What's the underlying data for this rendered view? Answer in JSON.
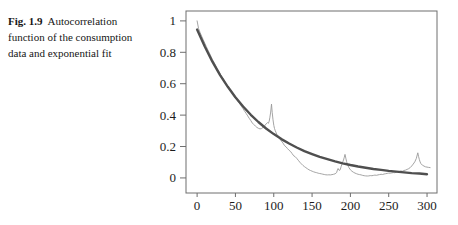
{
  "caption": {
    "label": "Fig. 1.9",
    "line1_rest": "Autocorrelation",
    "line2": "function of the consumption",
    "line3": "data and exponential fit"
  },
  "chart_data": {
    "type": "line",
    "title": "",
    "xlabel": "",
    "ylabel": "",
    "xlim": [
      -14.5,
      313
    ],
    "ylim": [
      -0.096,
      1.063
    ],
    "grid": false,
    "legend": "none",
    "frame_color": "#6e6e6e",
    "background": "#ffffff",
    "x_ticks": [
      {
        "v": 0,
        "label": "0"
      },
      {
        "v": 50,
        "label": "50"
      },
      {
        "v": 100,
        "label": "100"
      },
      {
        "v": 150,
        "label": "150"
      },
      {
        "v": 200,
        "label": "200"
      },
      {
        "v": 250,
        "label": "250"
      },
      {
        "v": 300,
        "label": "300"
      }
    ],
    "y_ticks": [
      {
        "v": 0,
        "label": "0"
      },
      {
        "v": 0.2,
        "label": "0.2"
      },
      {
        "v": 0.4,
        "label": "0.4"
      },
      {
        "v": 0.6,
        "label": "0.6"
      },
      {
        "v": 0.8,
        "label": "0.8"
      },
      {
        "v": 1,
        "label": "1"
      }
    ],
    "series": [
      {
        "name": "autocorrelation",
        "color": "#9a9a9a",
        "width": 0.9,
        "points": [
          [
            0,
            1.0
          ],
          [
            2,
            0.95
          ],
          [
            4,
            0.924
          ],
          [
            6,
            0.902
          ],
          [
            8,
            0.88
          ],
          [
            10,
            0.858
          ],
          [
            12,
            0.836
          ],
          [
            14,
            0.815
          ],
          [
            16,
            0.795
          ],
          [
            18,
            0.775
          ],
          [
            20,
            0.755
          ],
          [
            22,
            0.736
          ],
          [
            24,
            0.717
          ],
          [
            26,
            0.699
          ],
          [
            28,
            0.681
          ],
          [
            30,
            0.663
          ],
          [
            32,
            0.646
          ],
          [
            34,
            0.633
          ],
          [
            36,
            0.613
          ],
          [
            38,
            0.594
          ],
          [
            40,
            0.582
          ],
          [
            42,
            0.567
          ],
          [
            44,
            0.556
          ],
          [
            46,
            0.538
          ],
          [
            48,
            0.52
          ],
          [
            50,
            0.511
          ],
          [
            52,
            0.497
          ],
          [
            54,
            0.484
          ],
          [
            56,
            0.47
          ],
          [
            58,
            0.455
          ],
          [
            60,
            0.44
          ],
          [
            62,
            0.425
          ],
          [
            64,
            0.41
          ],
          [
            66,
            0.395
          ],
          [
            68,
            0.38
          ],
          [
            70,
            0.365
          ],
          [
            72,
            0.35
          ],
          [
            74,
            0.34
          ],
          [
            76,
            0.33
          ],
          [
            78,
            0.322
          ],
          [
            80,
            0.316
          ],
          [
            82,
            0.312
          ],
          [
            84,
            0.314
          ],
          [
            86,
            0.322
          ],
          [
            88,
            0.332
          ],
          [
            90,
            0.344
          ],
          [
            92,
            0.352
          ],
          [
            93,
            0.348
          ],
          [
            94,
            0.362
          ],
          [
            95,
            0.386
          ],
          [
            96,
            0.42
          ],
          [
            97,
            0.47
          ],
          [
            98,
            0.418
          ],
          [
            99,
            0.37
          ],
          [
            100,
            0.335
          ],
          [
            101,
            0.315
          ],
          [
            102,
            0.3
          ],
          [
            104,
            0.278
          ],
          [
            106,
            0.265
          ],
          [
            108,
            0.248
          ],
          [
            110,
            0.235
          ],
          [
            112,
            0.222
          ],
          [
            114,
            0.206
          ],
          [
            116,
            0.198
          ],
          [
            118,
            0.187
          ],
          [
            120,
            0.176
          ],
          [
            122,
            0.168
          ],
          [
            124,
            0.155
          ],
          [
            126,
            0.141
          ],
          [
            128,
            0.135
          ],
          [
            130,
            0.125
          ],
          [
            132,
            0.112
          ],
          [
            134,
            0.1
          ],
          [
            136,
            0.09
          ],
          [
            138,
            0.08
          ],
          [
            140,
            0.072
          ],
          [
            142,
            0.065
          ],
          [
            144,
            0.058
          ],
          [
            146,
            0.052
          ],
          [
            148,
            0.047
          ],
          [
            150,
            0.043
          ],
          [
            152,
            0.039
          ],
          [
            154,
            0.036
          ],
          [
            156,
            0.033
          ],
          [
            158,
            0.03
          ],
          [
            160,
            0.028
          ],
          [
            162,
            0.026
          ],
          [
            164,
            0.024
          ],
          [
            166,
            0.022
          ],
          [
            168,
            0.02
          ],
          [
            170,
            0.019
          ],
          [
            172,
            0.02
          ],
          [
            174,
            0.019
          ],
          [
            176,
            0.021
          ],
          [
            178,
            0.023
          ],
          [
            180,
            0.026
          ],
          [
            182,
            0.034
          ],
          [
            183,
            0.05
          ],
          [
            184,
            0.06
          ],
          [
            185,
            0.05
          ],
          [
            186,
            0.048
          ],
          [
            187,
            0.056
          ],
          [
            188,
            0.074
          ],
          [
            189,
            0.088
          ],
          [
            190,
            0.1
          ],
          [
            191,
            0.114
          ],
          [
            192,
            0.132
          ],
          [
            193,
            0.15
          ],
          [
            194,
            0.126
          ],
          [
            195,
            0.104
          ],
          [
            196,
            0.088
          ],
          [
            198,
            0.066
          ],
          [
            200,
            0.052
          ],
          [
            202,
            0.043
          ],
          [
            204,
            0.036
          ],
          [
            206,
            0.031
          ],
          [
            208,
            0.027
          ],
          [
            210,
            0.023
          ],
          [
            212,
            0.021
          ],
          [
            214,
            0.019
          ],
          [
            216,
            0.016
          ],
          [
            218,
            0.014
          ],
          [
            220,
            0.013
          ],
          [
            222,
            0.012
          ],
          [
            224,
            0.013
          ],
          [
            226,
            0.015
          ],
          [
            228,
            0.014
          ],
          [
            230,
            0.016
          ],
          [
            232,
            0.018
          ],
          [
            234,
            0.017
          ],
          [
            236,
            0.019
          ],
          [
            238,
            0.021
          ],
          [
            240,
            0.023
          ],
          [
            242,
            0.022
          ],
          [
            244,
            0.025
          ],
          [
            246,
            0.027
          ],
          [
            248,
            0.029
          ],
          [
            250,
            0.031
          ],
          [
            252,
            0.03
          ],
          [
            254,
            0.032
          ],
          [
            256,
            0.034
          ],
          [
            258,
            0.033
          ],
          [
            260,
            0.036
          ],
          [
            262,
            0.039
          ],
          [
            264,
            0.041
          ],
          [
            266,
            0.044
          ],
          [
            268,
            0.043
          ],
          [
            270,
            0.047
          ],
          [
            272,
            0.05
          ],
          [
            274,
            0.054
          ],
          [
            276,
            0.059
          ],
          [
            278,
            0.066
          ],
          [
            280,
            0.076
          ],
          [
            282,
            0.088
          ],
          [
            284,
            0.103
          ],
          [
            286,
            0.124
          ],
          [
            288,
            0.16
          ],
          [
            289,
            0.136
          ],
          [
            290,
            0.116
          ],
          [
            291,
            0.102
          ],
          [
            292,
            0.091
          ],
          [
            294,
            0.081
          ],
          [
            296,
            0.075
          ],
          [
            298,
            0.071
          ],
          [
            300,
            0.069
          ],
          [
            302,
            0.067
          ],
          [
            304,
            0.066
          ]
        ]
      },
      {
        "name": "exponential-fit",
        "color": "#4f4f4f",
        "width": 2.4,
        "points": [
          [
            0,
            0.945
          ],
          [
            10,
            0.837
          ],
          [
            20,
            0.74
          ],
          [
            30,
            0.655
          ],
          [
            40,
            0.58
          ],
          [
            50,
            0.514
          ],
          [
            60,
            0.455
          ],
          [
            70,
            0.402
          ],
          [
            80,
            0.356
          ],
          [
            90,
            0.315
          ],
          [
            100,
            0.279
          ],
          [
            110,
            0.247
          ],
          [
            120,
            0.219
          ],
          [
            130,
            0.194
          ],
          [
            140,
            0.171
          ],
          [
            150,
            0.152
          ],
          [
            160,
            0.134
          ],
          [
            170,
            0.119
          ],
          [
            180,
            0.105
          ],
          [
            190,
            0.093
          ],
          [
            200,
            0.082
          ],
          [
            210,
            0.073
          ],
          [
            220,
            0.065
          ],
          [
            230,
            0.057
          ],
          [
            240,
            0.051
          ],
          [
            250,
            0.045
          ],
          [
            260,
            0.04
          ],
          [
            270,
            0.035
          ],
          [
            280,
            0.031
          ],
          [
            290,
            0.028
          ],
          [
            300,
            0.024
          ]
        ]
      }
    ]
  }
}
